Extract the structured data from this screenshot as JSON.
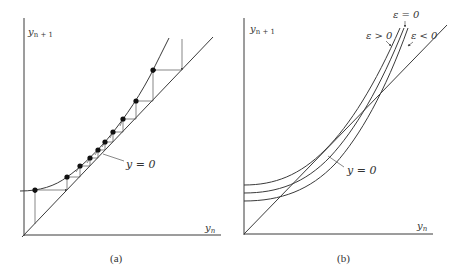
{
  "panels": [
    {
      "id": "a",
      "caption": "(a)",
      "y_axis_label": "y",
      "y_axis_sub": "n + 1",
      "x_axis_label": "y",
      "x_axis_sub": "n",
      "curve_label": "y = 0",
      "dots": [
        [
          35,
          190
        ],
        [
          67,
          177
        ],
        [
          80,
          166
        ],
        [
          90,
          158
        ],
        [
          98,
          150
        ],
        [
          105,
          142
        ],
        [
          113,
          132
        ],
        [
          123,
          119
        ],
        [
          136,
          101
        ],
        [
          153,
          70
        ]
      ]
    },
    {
      "id": "b",
      "caption": "(b)",
      "y_axis_label": "y",
      "y_axis_sub": "n + 1",
      "x_axis_label": "y",
      "x_axis_sub": "n",
      "curve_label": "y = 0",
      "curve_labels": {
        "eps_zero": "ε = 0",
        "eps_pos": "ε > 0",
        "eps_neg": "ε < 0"
      }
    }
  ],
  "colors": {
    "line": "#3a3a3a",
    "text": "#333333",
    "background": "#ffffff"
  }
}
